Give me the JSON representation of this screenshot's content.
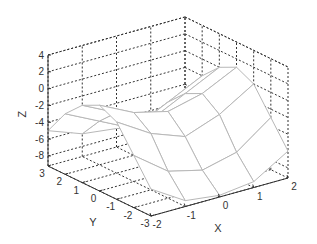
{
  "chart_data": {
    "type": "surface",
    "title": "",
    "xlabel": "X",
    "ylabel": "Y",
    "zlabel": "Z",
    "xlim": [
      -2,
      2
    ],
    "ylim": [
      -3,
      3
    ],
    "zlim": [
      -9.2,
      4
    ],
    "xticks": [
      "-2",
      "-1",
      "0",
      "1",
      "2"
    ],
    "yticks": [
      "-3",
      "-2",
      "-1",
      "0",
      "1",
      "2",
      "3"
    ],
    "zticks": [
      "-8",
      "-6",
      "-4",
      "-2",
      "0",
      "2",
      "4"
    ],
    "grid": true,
    "x": [
      -2,
      -1,
      0,
      1,
      2
    ],
    "y": [
      -3,
      -2,
      -1,
      0,
      1,
      2,
      3
    ],
    "z": [
      [
        -6,
        -8.5,
        -9,
        -8.5,
        -6
      ],
      [
        -3,
        -6,
        -7,
        -6,
        -3
      ],
      [
        0,
        -2.5,
        -4,
        -2.5,
        0
      ],
      [
        1,
        -1,
        -2,
        -1,
        1
      ],
      [
        0,
        -2,
        -4,
        -2,
        0
      ],
      [
        -2,
        -4,
        -6,
        -4,
        -2
      ],
      [
        -5,
        -6.5,
        -7,
        -6.5,
        -5
      ]
    ],
    "colors": {
      "surface_fill": "#ffffff",
      "surface_edge": "#b8b8b8",
      "surface_edge_dark": "#555555",
      "axis": "#333333",
      "grid": "#333333"
    }
  }
}
